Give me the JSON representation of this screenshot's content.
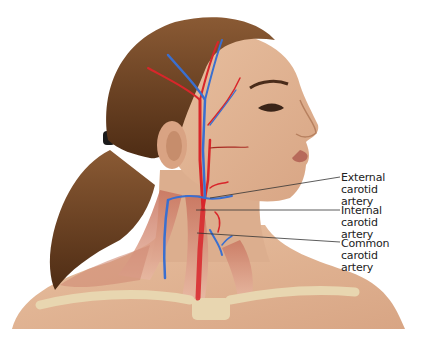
{
  "figure": {
    "colors": {
      "artery": "#d8262b",
      "vein": "#3a6fd0",
      "skin": "#e2b596",
      "hair": "#6b3e1e",
      "muscle": "#c97460",
      "bone": "#e8d6b0",
      "leader_line": "#333333"
    }
  },
  "labels": [
    {
      "line1": "External carotid",
      "line2": "artery"
    },
    {
      "line1": "Internal carotid",
      "line2": "artery"
    },
    {
      "line1": "Common carotid",
      "line2": "artery"
    }
  ]
}
